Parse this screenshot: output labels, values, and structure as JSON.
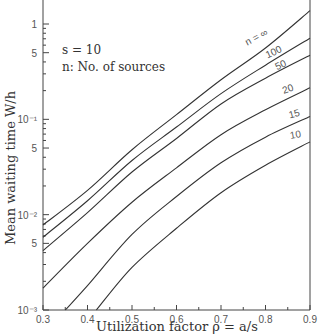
{
  "chart_data": {
    "type": "line",
    "title": "",
    "xlabel": "Utilization factor ρ = a/s",
    "ylabel": "Mean waiting time W/h",
    "xlim": [
      0.3,
      0.9
    ],
    "ylim": [
      0.001,
      2
    ],
    "yscale": "log",
    "grid": false,
    "x_ticks": [
      "0.3",
      "0.4",
      "0.5",
      "0.6",
      "0.7",
      "0.8",
      "0.9"
    ],
    "y_ticks": [
      {
        "value": 0.001,
        "label": "10⁻³"
      },
      {
        "value": 0.005,
        "label": "5"
      },
      {
        "value": 0.01,
        "label": "10⁻²"
      },
      {
        "value": 0.05,
        "label": "5"
      },
      {
        "value": 0.1,
        "label": "10⁻¹"
      },
      {
        "value": 0.5,
        "label": "5"
      },
      {
        "value": 1,
        "label": "1"
      }
    ],
    "annotations": [
      {
        "text": "s = 10"
      },
      {
        "text": "n: No. of sources"
      }
    ],
    "series": [
      {
        "name": "n = ∞",
        "label": "n = ∞",
        "x": [
          0.3,
          0.4,
          0.5,
          0.6,
          0.7,
          0.8,
          0.9
        ],
        "y": [
          0.0078,
          0.018,
          0.048,
          0.112,
          0.26,
          0.56,
          1.38
        ]
      },
      {
        "name": "100",
        "label": "100",
        "x": [
          0.3,
          0.4,
          0.5,
          0.6,
          0.7,
          0.8,
          0.9
        ],
        "y": [
          0.0058,
          0.014,
          0.037,
          0.083,
          0.186,
          0.37,
          0.71
        ]
      },
      {
        "name": "50",
        "label": "50",
        "x": [
          0.3,
          0.4,
          0.5,
          0.6,
          0.7,
          0.8,
          0.9
        ],
        "y": [
          0.0042,
          0.0105,
          0.028,
          0.063,
          0.145,
          0.27,
          0.47
        ]
      },
      {
        "name": "20",
        "label": "20",
        "x": [
          0.3,
          0.4,
          0.5,
          0.6,
          0.7,
          0.8,
          0.9
        ],
        "y": [
          0.0017,
          0.005,
          0.0135,
          0.031,
          0.069,
          0.126,
          0.214
        ]
      },
      {
        "name": "15",
        "label": "15",
        "x": [
          0.35,
          0.4,
          0.5,
          0.6,
          0.7,
          0.8,
          0.9
        ],
        "y": [
          0.001,
          0.0018,
          0.0062,
          0.0155,
          0.035,
          0.065,
          0.107
        ]
      },
      {
        "name": "10",
        "label": "10",
        "x": [
          0.42,
          0.5,
          0.6,
          0.7,
          0.8,
          0.9
        ],
        "y": [
          0.001,
          0.0028,
          0.0072,
          0.017,
          0.033,
          0.058
        ]
      }
    ]
  },
  "text": {
    "s_param": "s = 10",
    "n_legend": "n: No. of sources",
    "xlabel": "Utilization factor ρ = a/s",
    "ylabel": "Mean waiting time W/h"
  }
}
